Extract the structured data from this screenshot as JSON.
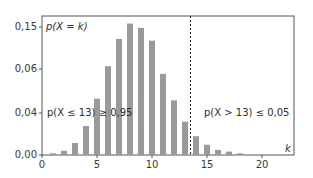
{
  "chart_data": {
    "type": "bar",
    "title": "",
    "xlabel": "k",
    "ylabel": "p(X = k)",
    "x": [
      1,
      2,
      3,
      4,
      5,
      6,
      7,
      8,
      9,
      10,
      11,
      12,
      13,
      14,
      15,
      16,
      17,
      18
    ],
    "values": [
      0.002,
      0.005,
      0.014,
      0.034,
      0.066,
      0.104,
      0.136,
      0.154,
      0.149,
      0.134,
      0.095,
      0.064,
      0.039,
      0.022,
      0.012,
      0.006,
      0.004,
      0.002
    ],
    "xlim": [
      0,
      22.5
    ],
    "ylim": [
      0,
      0.175
    ],
    "x_ticks": [
      0,
      5,
      10,
      15,
      20
    ],
    "x_tick_labels": [
      "0",
      "5",
      "10",
      "15",
      "20"
    ],
    "y_tick_labels": [
      "0,15",
      "0,06",
      "0,04",
      "0,00"
    ],
    "grid": false,
    "bar_color": "#9a9a9a",
    "threshold": {
      "x": 13.5,
      "style": "dashed",
      "color": "#222222"
    },
    "annotations": [
      {
        "text": "p(X = k)",
        "position": "top-left"
      },
      {
        "text": "p(X ≤ 13) ≥ 0,95",
        "position": "left of threshold"
      },
      {
        "text": "p(X > 13) ≤ 0,05",
        "position": "right of threshold"
      },
      {
        "text": "k",
        "position": "x-axis end"
      }
    ]
  },
  "labels": {
    "y_axis_label": "p(X = k)",
    "left_region": "p(X ≤ 13) ≥ 0,95",
    "right_region": "p(X > 13) ≤ 0,05",
    "x_axis_label": "k"
  }
}
